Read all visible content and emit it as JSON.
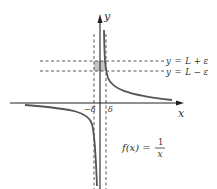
{
  "diagram": {
    "axes": {
      "x_label": "x",
      "y_label": "y"
    },
    "horizontal_lines": [
      {
        "label_lhs": "y",
        "label_eq": "=",
        "label_rhs": "L + ε",
        "text": "y = L + ε"
      },
      {
        "label_lhs": "y",
        "label_eq": "=",
        "label_rhs": "L − ε",
        "text": "y = L − ε"
      }
    ],
    "vertical_lines": [
      {
        "label": "−δ"
      },
      {
        "label": "δ"
      }
    ],
    "function": {
      "lhs": "f(x) =",
      "numerator": "1",
      "denominator": "x",
      "text": "f(x) = 1/x"
    },
    "colors": {
      "curve": "#555555",
      "axis": "#222222",
      "dashed": "#444444",
      "shade": "#bdbdbd",
      "text": "#333333"
    }
  }
}
